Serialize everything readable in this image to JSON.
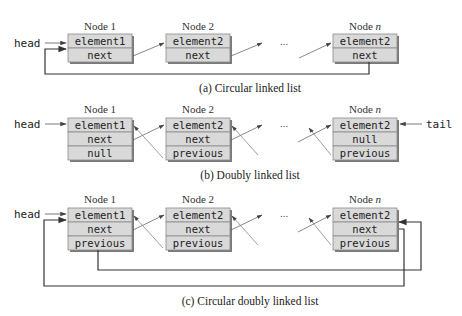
{
  "colors": {
    "cell_fill": "#d9d9d9",
    "cell_border": "#8a8a8a",
    "shadow": "#7a7a7a",
    "line": "#333333",
    "thin_line": "#555555"
  },
  "diagrams": [
    {
      "id": "a",
      "caption": "(a) Circular linked list",
      "head_label": "head",
      "nodes": [
        {
          "title": "Node 1",
          "title_var": "",
          "cells": [
            "element1",
            "next"
          ]
        },
        {
          "title": "Node 2",
          "title_var": "",
          "cells": [
            "element2",
            "next"
          ]
        },
        {
          "title": "Node ",
          "title_var": "n",
          "cells": [
            "element2",
            "next"
          ]
        }
      ],
      "ellipsis": "..."
    },
    {
      "id": "b",
      "caption": "(b) Doubly linked list",
      "head_label": "head",
      "tail_label": "tail",
      "nodes": [
        {
          "title": "Node 1",
          "title_var": "",
          "cells": [
            "element1",
            "next",
            "null"
          ]
        },
        {
          "title": "Node 2",
          "title_var": "",
          "cells": [
            "element2",
            "next",
            "previous"
          ]
        },
        {
          "title": "Node ",
          "title_var": "n",
          "cells": [
            "element2",
            "null",
            "previous"
          ]
        }
      ],
      "ellipsis": "..."
    },
    {
      "id": "c",
      "caption": "(c) Circular doubly linked list",
      "head_label": "head",
      "nodes": [
        {
          "title": "Node 1",
          "title_var": "",
          "cells": [
            "element1",
            "next",
            "previous"
          ]
        },
        {
          "title": "Node 2",
          "title_var": "",
          "cells": [
            "element2",
            "next",
            "previous"
          ]
        },
        {
          "title": "Node ",
          "title_var": "n",
          "cells": [
            "element2",
            "next",
            "previous"
          ]
        }
      ],
      "ellipsis": "..."
    }
  ]
}
